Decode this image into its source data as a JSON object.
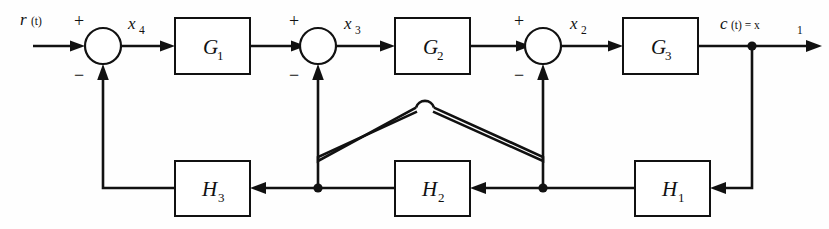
{
  "diagram": {
    "type": "control-system-block-diagram",
    "colors": {
      "line": "#111111",
      "background": "#fefefe",
      "box_fill": "#ffffff"
    },
    "input_signal": {
      "label": "r(t)",
      "base": "r",
      "arg": "(t)"
    },
    "output_signal": {
      "label": "c(t) = x1",
      "base": "c",
      "arg": "(t) = x",
      "sub": "1"
    },
    "forward_blocks": [
      {
        "id": "G1",
        "base": "G",
        "sub": "1",
        "x": 175,
        "y": 18,
        "w": 75,
        "h": 56
      },
      {
        "id": "G2",
        "base": "G",
        "sub": "2",
        "x": 395,
        "y": 18,
        "w": 75,
        "h": 56
      },
      {
        "id": "G3",
        "base": "G",
        "sub": "3",
        "x": 623,
        "y": 18,
        "w": 75,
        "h": 56
      }
    ],
    "feedback_blocks": [
      {
        "id": "H3",
        "base": "H",
        "sub": "3",
        "x": 175,
        "y": 161,
        "w": 75,
        "h": 55
      },
      {
        "id": "H2",
        "base": "H",
        "sub": "2",
        "x": 395,
        "y": 161,
        "w": 75,
        "h": 55
      },
      {
        "id": "H1",
        "base": "H",
        "sub": "1",
        "x": 635,
        "y": 161,
        "w": 75,
        "h": 55
      }
    ],
    "summing_junctions": [
      {
        "id": "sum1",
        "cx": 103,
        "cy": 46,
        "r": 18,
        "plus": "+",
        "minus": "−",
        "plus_side": "top-left",
        "minus_side": "bottom-left"
      },
      {
        "id": "sum2",
        "cx": 318,
        "cy": 46,
        "r": 18,
        "plus": "+",
        "minus": "−",
        "plus_side": "top-left",
        "minus_side": "bottom-left"
      },
      {
        "id": "sum3",
        "cx": 543,
        "cy": 46,
        "r": 18,
        "plus": "+",
        "minus": "−",
        "plus_side": "top-left",
        "minus_side": "bottom-left"
      }
    ],
    "signal_labels": [
      {
        "id": "x4",
        "base": "x",
        "sub": "4",
        "x": 128,
        "y": 24
      },
      {
        "id": "x3",
        "base": "x",
        "sub": "3",
        "x": 344,
        "y": 24
      },
      {
        "id": "x2",
        "base": "x",
        "sub": "2",
        "x": 570,
        "y": 24
      }
    ],
    "junction_dots": [
      {
        "id": "output-tap",
        "cx": 752,
        "cy": 46
      },
      {
        "id": "h2-input-tap",
        "cx": 543,
        "cy": 188
      },
      {
        "id": "h3-input-tap",
        "cx": 318,
        "cy": 188
      }
    ],
    "crossover": {
      "id": "wire-hop",
      "cx": 425,
      "cy": 108,
      "note": "semicircular jump where the two inner feedback wires cross"
    },
    "wire_rows": {
      "forward_y": 46,
      "feedback_y": 188
    }
  }
}
